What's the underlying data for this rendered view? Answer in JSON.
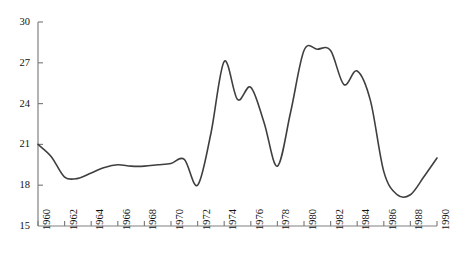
{
  "chart_data": {
    "type": "line",
    "title": "",
    "xlabel": "",
    "ylabel": "",
    "xlim": [
      1960,
      1990
    ],
    "ylim": [
      15,
      30
    ],
    "grid": false,
    "legend": null,
    "yticks": [
      15,
      18,
      21,
      24,
      27,
      30
    ],
    "ytick_labels": [
      "15",
      "18",
      "21",
      "24",
      "27",
      "30"
    ],
    "xticks": [
      1960,
      1962,
      1964,
      1966,
      1968,
      1970,
      1972,
      1974,
      1976,
      1978,
      1980,
      1982,
      1984,
      1986,
      1988,
      1990
    ],
    "xtick_labels": [
      "1960",
      "1962",
      "1964",
      "1966",
      "1968",
      "1970",
      "1972",
      "1974",
      "1976",
      "1978",
      "1980",
      "1982",
      "1984",
      "1986",
      "1988",
      "1990"
    ],
    "series": [
      {
        "name": "series-1",
        "color": "#3f3f3f",
        "x": [
          1960,
          1961,
          1962,
          1963,
          1964,
          1965,
          1966,
          1967,
          1968,
          1969,
          1970,
          1971,
          1972,
          1973,
          1974,
          1975,
          1976,
          1977,
          1978,
          1979,
          1980,
          1981,
          1982,
          1983,
          1984,
          1985,
          1986,
          1987,
          1988,
          1989,
          1990
        ],
        "values": [
          21.0,
          20.1,
          18.6,
          18.5,
          18.9,
          19.3,
          19.5,
          19.4,
          19.4,
          19.5,
          19.6,
          19.9,
          18.0,
          21.8,
          27.1,
          24.3,
          25.2,
          22.6,
          19.4,
          23.4,
          27.9,
          28.0,
          27.9,
          25.4,
          26.4,
          24.2,
          19.0,
          17.3,
          17.3,
          18.6,
          20.0
        ]
      }
    ]
  },
  "axes": {
    "y_axis_name": "y-axis",
    "x_axis_name": "x-axis"
  }
}
